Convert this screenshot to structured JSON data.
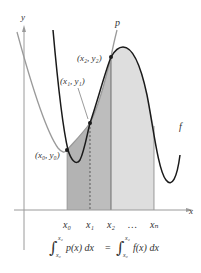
{
  "diagram": {
    "axes": {
      "x_label": "x",
      "y_label": "y"
    },
    "curves": [
      {
        "name": "p",
        "label": "p",
        "color": "#8a8a8a",
        "description": "interpolating polynomial"
      },
      {
        "name": "f",
        "label": "f",
        "color": "#1a1a1a",
        "description": "function"
      }
    ],
    "points": [
      {
        "label": "(x₀, y₀)"
      },
      {
        "label": "(x₁, y₁)"
      },
      {
        "label": "(x₂, y₂)"
      }
    ],
    "ticks": [
      "x₀",
      "x₁",
      "x₂",
      "…",
      "xₙ"
    ],
    "shading": {
      "dark_region": "#b8b8b8",
      "light_region": "#dcdcdc"
    },
    "formula": {
      "lhs_lower": "x₀",
      "lhs_upper": "x₂",
      "lhs_integrand": "p(x) dx",
      "equals": "=",
      "rhs_lower": "x₀",
      "rhs_upper": "x₂",
      "rhs_integrand": "f(x) dx"
    }
  }
}
